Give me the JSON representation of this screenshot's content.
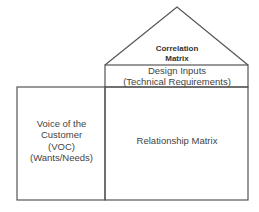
{
  "diagram": {
    "type": "House of Quality (QFD)",
    "roof": {
      "title_line1": "Correlation",
      "title_line2": "Matrix"
    },
    "design_inputs": {
      "line1": "Design Inputs",
      "line2": "(Technical Requirements)"
    },
    "voc": {
      "line1": "Voice of the",
      "line2": "Customer",
      "line3": "(VOC)",
      "line4": "(Wants/Needs)"
    },
    "relationship": {
      "label": "Relationship Matrix"
    },
    "colors": {
      "stroke": "#555555",
      "text": "#444444",
      "background": "#ffffff"
    }
  }
}
